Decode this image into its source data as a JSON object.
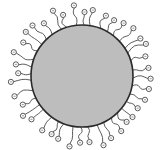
{
  "diagram": {
    "type": "ligand-coated-particle",
    "core": {
      "shape": "circle",
      "cx": 82,
      "cy": 76,
      "r": 51,
      "fill": "#bdbdbd",
      "stroke": "#2a2a2a"
    },
    "ligands": {
      "count": 40,
      "chain_color": "#333333",
      "head_group": "small-circle",
      "head_radius": 2.6,
      "head_fill": "#ffffff",
      "head_stroke": "#333333"
    },
    "background": "#ffffff"
  }
}
